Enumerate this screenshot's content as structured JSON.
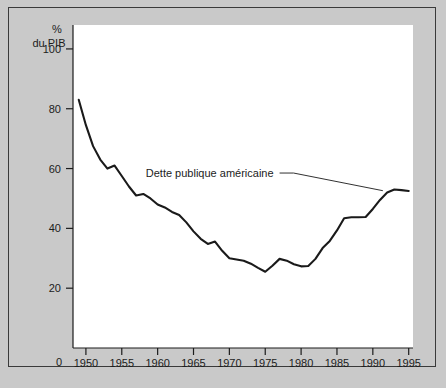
{
  "figure": {
    "background_color": "#c9c9c9",
    "plot_background_color": "#ffffff",
    "border_color": "#3a3a3a",
    "line_color": "#1a1a1a"
  },
  "chart_data": {
    "type": "line",
    "title": "",
    "xlabel": "",
    "ylabel": "% du PIB",
    "ylabel_lines": [
      "%",
      "du PIB"
    ],
    "grid": false,
    "legend": "none",
    "xlim": [
      1948.2,
      1995.6
    ],
    "ylim": [
      0,
      108
    ],
    "yticks": [
      20,
      40,
      60,
      80,
      100
    ],
    "ytick_labels": [
      "20",
      "40",
      "60",
      "80",
      "100"
    ],
    "xticks": [
      1950,
      1955,
      1960,
      1965,
      1970,
      1975,
      1980,
      1985,
      1990,
      1995
    ],
    "xtick_labels": [
      "1950",
      "1955",
      "1960",
      "1965",
      "1970",
      "1975",
      "1980",
      "1985",
      "1990",
      "1995"
    ],
    "origin_label": "0",
    "annotations": [
      {
        "text": "Dette publique américaine",
        "leader_from_x": 1977.0,
        "leader_from_y": 58.5,
        "leader_to_x": 1991.4,
        "leader_to_y": 52.6
      }
    ],
    "series": [
      {
        "name": "Dette publique américaine",
        "x": [
          1949,
          1950,
          1951,
          1952,
          1953,
          1954,
          1955,
          1956,
          1957,
          1958,
          1959,
          1960,
          1961,
          1962,
          1963,
          1964,
          1965,
          1966,
          1967,
          1968,
          1969,
          1970,
          1971,
          1972,
          1973,
          1974,
          1975,
          1976,
          1977,
          1978,
          1979,
          1980,
          1981,
          1982,
          1983,
          1984,
          1985,
          1986,
          1987,
          1988,
          1989,
          1990,
          1991,
          1992,
          1993,
          1994,
          1995
        ],
        "values": [
          83.0,
          74.5,
          67.5,
          63.0,
          60.0,
          61.0,
          57.5,
          54.0,
          51.0,
          51.5,
          50.0,
          48.0,
          47.0,
          45.5,
          44.5,
          42.0,
          39.0,
          36.5,
          34.8,
          35.6,
          32.5,
          30.0,
          29.6,
          29.2,
          28.2,
          26.8,
          25.5,
          27.5,
          29.8,
          29.2,
          28.0,
          27.3,
          27.4,
          29.8,
          33.4,
          35.8,
          39.3,
          43.4,
          43.7,
          43.7,
          43.8,
          46.5,
          49.5,
          52.0,
          53.0,
          52.8,
          52.5
        ]
      }
    ]
  }
}
